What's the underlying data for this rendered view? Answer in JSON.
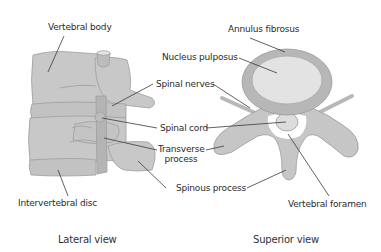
{
  "diagram": {
    "views": [
      {
        "id": "lateral",
        "caption": "Lateral view"
      },
      {
        "id": "superior",
        "caption": "Superior view"
      }
    ],
    "labels": {
      "vertebral_body": "Vertebral body",
      "annulus_fibrosus": "Annulus fibrosus",
      "nucleus_pulposus": "Nucleus pulposus",
      "spinal_nerves": "Spinal nerves",
      "spinal_cord": "Spinal cord",
      "transverse_process_line1": "Transverse",
      "transverse_process_line2": "process",
      "spinous_process": "Spinous process",
      "intervertebral_disc": "Intervertebral disc",
      "vertebral_foramen": "Vertebral foramen"
    },
    "colors": {
      "bone_fill": "#c8c8c8",
      "bone_stroke": "#9a9a9a",
      "disc_outer": "#b5b5b5",
      "nucleus": "#e2e2e2",
      "cord": "#dedede",
      "leader_line": "#3a3a3a",
      "text": "#2b2b2b"
    }
  }
}
